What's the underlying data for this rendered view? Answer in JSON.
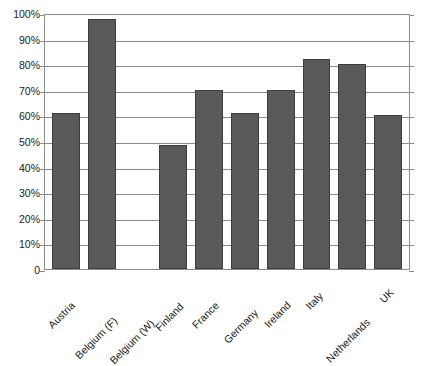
{
  "chart_data": {
    "type": "bar",
    "title": "",
    "subtitle": "",
    "xlabel": "",
    "ylabel": "",
    "categories": [
      "Austria",
      "Belgium (F)",
      "Belgium (W)",
      "Finland",
      "France",
      "Germany",
      "Ireland",
      "Italy",
      "Netherlands",
      "UK"
    ],
    "values": [
      61,
      97.5,
      0,
      48.5,
      70,
      61,
      70,
      82,
      80,
      60
    ],
    "ylim": [
      0,
      100
    ],
    "ytick_values": [
      0,
      10,
      20,
      30,
      40,
      50,
      60,
      70,
      80,
      90,
      100
    ],
    "ytick_labels": [
      "0",
      "10%",
      "20%",
      "30%",
      "40%",
      "50%",
      "60%",
      "70%",
      "80%",
      "90%",
      "100%"
    ],
    "grid": true,
    "legend": false,
    "legend_position": "none",
    "bar_color": "#595959",
    "bar_border_color": "#3d3d3d",
    "grid_color": "#8c8c8c",
    "axis_color": "#8c8c8c",
    "text_color": "#1a1a1a",
    "background": "#ffffff",
    "x_label_rotation": -45
  }
}
